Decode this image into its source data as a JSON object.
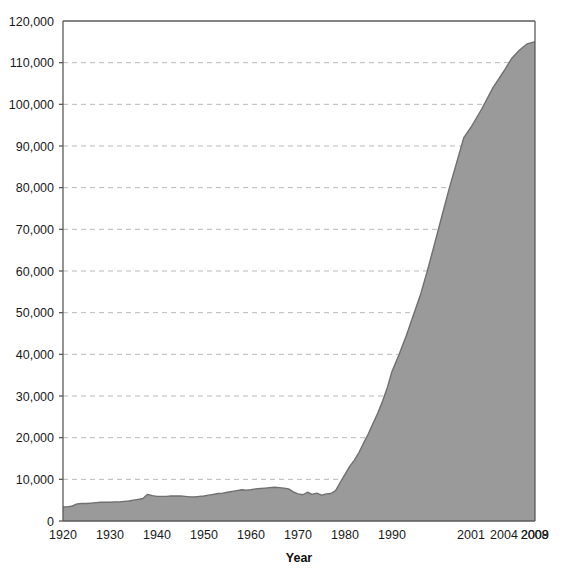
{
  "chart_data": {
    "type": "area",
    "title": "",
    "xlabel": "Year",
    "ylabel": "",
    "xlim": [
      1920,
      2009
    ],
    "ylim": [
      0,
      120000
    ],
    "grid": true,
    "grid_axis": "y",
    "legend": "none",
    "series_name": "Count",
    "fill_color": "#9a9a9a",
    "line_color": "#6f6f6f",
    "grid_color": "#b9b9b9",
    "axis_color": "#5a5a5a",
    "background_color": "#ffffff",
    "text_color": "#1a1a1a",
    "ytick_labels": [
      "0",
      "10,000",
      "20,000",
      "30,000",
      "40,000",
      "50,000",
      "60,000",
      "70,000",
      "80,000",
      "90,000",
      "100,000",
      "110,000",
      "120,000"
    ],
    "ytick_values": [
      0,
      10000,
      20000,
      30000,
      40000,
      50000,
      60000,
      70000,
      80000,
      90000,
      100000,
      110000,
      120000
    ],
    "xtick_labels": [
      "1920",
      "1930",
      "1940",
      "1950",
      "1960",
      "1970",
      "1980",
      "1990",
      "2001",
      "2004",
      "2008",
      "2009"
    ],
    "xtick_values": [
      1920,
      1930,
      1940,
      1950,
      1960,
      1970,
      1980,
      1990,
      2001,
      2004,
      2008,
      2009
    ],
    "xtick_positions": [
      0,
      0.0996,
      0.1992,
      0.2987,
      0.3983,
      0.4979,
      0.5975,
      0.697,
      0.8644,
      0.9343,
      0.9992,
      1.0
    ],
    "x": [
      1920,
      1921,
      1922,
      1923,
      1924,
      1925,
      1926,
      1927,
      1928,
      1929,
      1930,
      1931,
      1932,
      1933,
      1934,
      1935,
      1936,
      1937,
      1938,
      1939,
      1940,
      1941,
      1942,
      1943,
      1944,
      1945,
      1946,
      1947,
      1948,
      1949,
      1950,
      1951,
      1952,
      1953,
      1954,
      1955,
      1956,
      1957,
      1958,
      1959,
      1960,
      1961,
      1962,
      1963,
      1964,
      1965,
      1966,
      1967,
      1968,
      1969,
      1970,
      1971,
      1972,
      1973,
      1974,
      1975,
      1976,
      1977,
      1978,
      1979,
      1980,
      1981,
      1982,
      1983,
      1984,
      1985,
      1986,
      1987,
      1988,
      1989,
      1990,
      1991,
      1992,
      1993,
      1994,
      1995,
      1996,
      1997,
      1998,
      1999,
      2000,
      2001,
      2002,
      2003,
      2004,
      2005,
      2006,
      2007,
      2008,
      2009
    ],
    "values": [
      3400,
      3400,
      3600,
      4100,
      4200,
      4200,
      4300,
      4400,
      4500,
      4500,
      4500,
      4600,
      4600,
      4700,
      4800,
      5000,
      5200,
      5400,
      6400,
      6100,
      5900,
      5900,
      5900,
      6000,
      6000,
      6000,
      5900,
      5800,
      5800,
      5900,
      6000,
      6200,
      6400,
      6600,
      6700,
      6900,
      7100,
      7300,
      7500,
      7400,
      7500,
      7700,
      7800,
      7900,
      8000,
      8100,
      8000,
      7900,
      7700,
      7000,
      6500,
      6300,
      6900,
      6400,
      6700,
      6200,
      6500,
      6600,
      7300,
      9300,
      11200,
      13100,
      14600,
      16500,
      18800,
      21000,
      23500,
      26000,
      28800,
      32000,
      35900,
      40000,
      44500,
      49500,
      54500,
      60500,
      67000,
      73500,
      80000,
      86000,
      92000,
      94500,
      99000,
      104000,
      108000,
      111000,
      113000,
      114500,
      115000,
      115000
    ],
    "x_pixel_of_min": 63,
    "x_pixel_of_max": 535,
    "annotations": []
  }
}
